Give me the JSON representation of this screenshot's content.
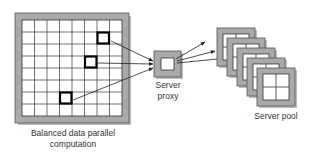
{
  "diagram": {
    "left_label": [
      "Balanced data parallel",
      "computation"
    ],
    "proxy_label": [
      "Server",
      "proxy"
    ],
    "pool_label": "Server pool",
    "grid": {
      "rows": 8,
      "cols": 8
    },
    "highlighted_cells": [
      {
        "row": 1,
        "col": 6
      },
      {
        "row": 3,
        "col": 5
      },
      {
        "row": 6,
        "col": 3
      }
    ],
    "pool_count": 5,
    "colors": {
      "frame": "#a9a9a9",
      "frame_border": "#555555",
      "grid_line": "#333333",
      "highlight": "#000000",
      "arrow": "#222222"
    }
  }
}
